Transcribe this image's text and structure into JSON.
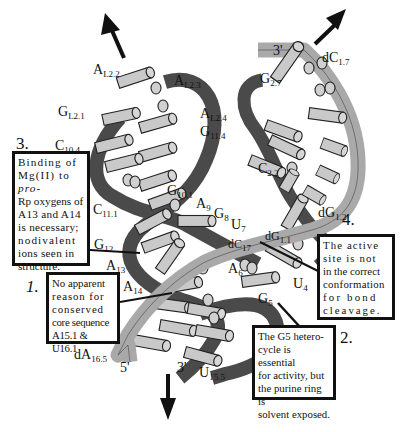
{
  "colors": {
    "dark_strand": "#4a4a4a",
    "light_strand": "#a9a9a9",
    "base_fill": "#c9c9c9",
    "box_border": "#111111",
    "background": "#ffffff"
  },
  "labels": {
    "AL22": {
      "base": "A",
      "sub": "L2.2"
    },
    "AL23": {
      "base": "A",
      "sub": "L2.3"
    },
    "AL24": {
      "base": "A",
      "sub": "L2.4"
    },
    "GL21": {
      "base": "G",
      "sub": "L2.1"
    },
    "G114": {
      "base": "G",
      "sub": "11.4"
    },
    "C104": {
      "base": "C",
      "sub": "10.4"
    },
    "G101": {
      "base": "G",
      "sub": "10.1"
    },
    "C111": {
      "base": "C",
      "sub": "11.1"
    },
    "A9": {
      "base": "A",
      "sub": "9"
    },
    "G8": {
      "base": "G",
      "sub": "8"
    },
    "U7": {
      "base": "U",
      "sub": "7"
    },
    "G12": {
      "base": "G",
      "sub": "12"
    },
    "A13": {
      "base": "A",
      "sub": "13"
    },
    "A14": {
      "base": "A",
      "sub": "14"
    },
    "A6": {
      "base": "A",
      "sub": "6"
    },
    "U4": {
      "base": "U",
      "sub": "4"
    },
    "G5": {
      "base": "G",
      "sub": "5"
    },
    "dC17": {
      "base": "dC",
      "sub": "17"
    },
    "dG11": {
      "base": "dG",
      "sub": "1.1"
    },
    "dG12": {
      "base": "dG",
      "sub": "1.2"
    },
    "G27": {
      "base": "G",
      "sub": "2.7"
    },
    "dC17top": {
      "base": "dC",
      "sub": "1.7"
    },
    "C22": {
      "base": "C",
      "sub": "2.2"
    },
    "dA165": {
      "base": "dA",
      "sub": "16.5"
    },
    "U155": {
      "base": "U",
      "sub": "15.5"
    }
  },
  "primes": {
    "top_right_3prime": "3'",
    "bottom_5prime": "5'",
    "bottom_3prime": "3'"
  },
  "annotations": [
    {
      "number": "1.",
      "text": "No apparent reason for conserved core sequence A15.1 & U16.1"
    },
    {
      "number": "2.",
      "text": "The G5 hetero-cycle is essential for activity, but the purine ring is solvent exposed."
    },
    {
      "number": "3.",
      "text": "Binding of Mg(II) to pro-Rp oxygens of A13 and A14 is necessary; nodivalent ions seen in structure."
    },
    {
      "number": "4.",
      "text": "The active site is not in the correct conformation for bond cleavage."
    }
  ],
  "box_lines": {
    "b1": [
      "No apparent",
      "reason for",
      "conserved",
      "core sequence",
      "A15.1 & U16.1"
    ],
    "b2": [
      "The G5 hetero-",
      "cycle is essential",
      "for activity, but",
      "the purine ring is",
      "solvent exposed."
    ],
    "b3": [
      "Binding of",
      "Mg(II) to ",
      "pro-",
      "Rp oxygens of",
      "A13 and A14",
      "is necessary;",
      "nodivalent",
      "ions seen in",
      "structure."
    ],
    "b4": [
      "The active",
      "site is not",
      "in the correct",
      "conformation",
      "for bond",
      "cleavage."
    ]
  },
  "arrows": [
    "arrow-up-left",
    "arrow-up-right",
    "arrow-down"
  ]
}
